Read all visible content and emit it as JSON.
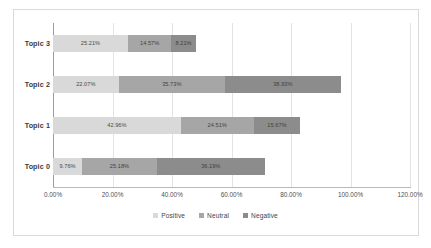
{
  "chart_data": {
    "type": "bar",
    "orientation": "horizontal",
    "stacked": true,
    "title": "",
    "xlabel": "",
    "ylabel": "",
    "categories": [
      "Topic 0",
      "Topic 1",
      "Topic 2",
      "Topic 3"
    ],
    "display_order": [
      "Topic 3",
      "Topic 2",
      "Topic 1",
      "Topic 0"
    ],
    "series": [
      {
        "name": "Positive",
        "color": "#d9d9d9",
        "values": [
          9.76,
          42.96,
          22.07,
          25.21
        ],
        "labels": [
          "9.76%",
          "42.96%",
          "22.07%",
          "25.21%"
        ]
      },
      {
        "name": "Neutral",
        "color": "#a6a6a6",
        "values": [
          25.18,
          24.51,
          35.73,
          14.57
        ],
        "labels": [
          "25.18%",
          "24.51%",
          "35.73%",
          "14.57%"
        ]
      },
      {
        "name": "Negative",
        "color": "#8c8c8c",
        "values": [
          36.19,
          15.67,
          38.93,
          8.21
        ],
        "labels": [
          "36.19%",
          "15.67%",
          "38.93%",
          "8.21%"
        ]
      }
    ],
    "xlim": [
      0,
      120
    ],
    "xticks": [
      0,
      20,
      40,
      60,
      80,
      100,
      120
    ],
    "xtick_labels": [
      "0.00%",
      "20.00%",
      "40.00%",
      "60.00%",
      "80.00%",
      "100.00%",
      "120.00%"
    ],
    "grid": true,
    "legend_position": "bottom",
    "legend_entries": [
      "Positive",
      "Neutral",
      "Negative"
    ]
  },
  "rows": [
    {
      "category": "Topic 3",
      "segments": [
        {
          "series": "Positive",
          "value": 25.21,
          "label": "25.21%"
        },
        {
          "series": "Neutral",
          "value": 14.57,
          "label": "14.57%"
        },
        {
          "series": "Negative",
          "value": 8.21,
          "label": "8.21%"
        }
      ]
    },
    {
      "category": "Topic 2",
      "segments": [
        {
          "series": "Positive",
          "value": 22.07,
          "label": "22.07%"
        },
        {
          "series": "Neutral",
          "value": 35.73,
          "label": "35.73%"
        },
        {
          "series": "Negative",
          "value": 38.93,
          "label": "38.93%"
        }
      ]
    },
    {
      "category": "Topic 1",
      "segments": [
        {
          "series": "Positive",
          "value": 42.96,
          "label": "42.96%"
        },
        {
          "series": "Neutral",
          "value": 24.51,
          "label": "24.51%"
        },
        {
          "series": "Negative",
          "value": 15.67,
          "label": "15.67%"
        }
      ]
    },
    {
      "category": "Topic 0",
      "segments": [
        {
          "series": "Positive",
          "value": 9.76,
          "label": "9.76%"
        },
        {
          "series": "Neutral",
          "value": 25.18,
          "label": "25.18%"
        },
        {
          "series": "Negative",
          "value": 36.19,
          "label": "36.19%"
        }
      ]
    }
  ],
  "axis": {
    "tick_labels": [
      "0.00%",
      "20.00%",
      "40.00%",
      "60.00%",
      "80.00%",
      "100.00%",
      "120.00%"
    ],
    "max": 120
  },
  "legend": {
    "items": [
      {
        "label": "Positive",
        "color": "#d9d9d9"
      },
      {
        "label": "Neutral",
        "color": "#a6a6a6"
      },
      {
        "label": "Negative",
        "color": "#8c8c8c"
      }
    ]
  }
}
